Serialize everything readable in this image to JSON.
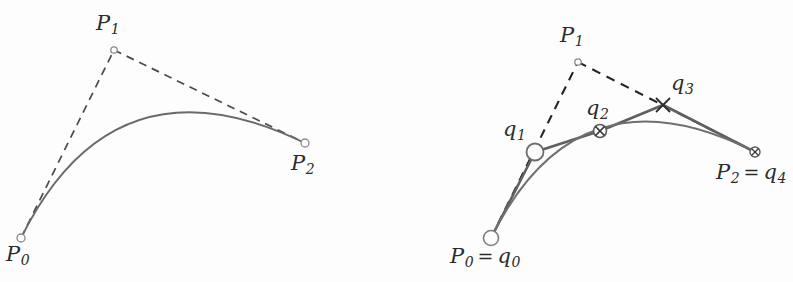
{
  "figure": {
    "background_color": "#fdfdfd",
    "curve_color": "#6a6a6a",
    "dashed_color": "#4a4a4a",
    "dashed_color_right": "#242424",
    "polyline_color": "#5f5f5f",
    "label_color": "#2b2b2b",
    "width": 793,
    "height": 282
  },
  "left_panel": {
    "name": "bezier-control-polygon",
    "labels": {
      "p0": {
        "base": "P",
        "sub": "0"
      },
      "p1": {
        "base": "P",
        "sub": "1"
      },
      "p2": {
        "base": "P",
        "sub": "2"
      }
    },
    "points": {
      "p0": {
        "x": 21,
        "y": 238,
        "marker": "small-open-circle"
      },
      "p1": {
        "x": 114,
        "y": 50,
        "marker": "tiny-open-circle"
      },
      "p2": {
        "x": 305,
        "y": 143,
        "marker": "small-open-circle"
      }
    },
    "curve": {
      "type": "quadratic-bezier",
      "start": {
        "x": 21,
        "y": 238
      },
      "control": {
        "x": 114,
        "y": 50
      },
      "end": {
        "x": 305,
        "y": 143
      }
    }
  },
  "right_panel": {
    "name": "bezier-subdivision-polyline",
    "labels": {
      "p0q0": {
        "base": "P",
        "sub": "0",
        "eq": "=",
        "base2": "q",
        "sub2": "0"
      },
      "p1": {
        "base": "P",
        "sub": "1"
      },
      "p2q4": {
        "base": "P",
        "sub": "2",
        "eq": "=",
        "base2": "q",
        "sub2": "4"
      },
      "q1": {
        "base": "q",
        "sub": "1"
      },
      "q2": {
        "base": "q",
        "sub": "2"
      },
      "q3": {
        "base": "q",
        "sub": "3"
      }
    },
    "points": {
      "q0": {
        "x": 491,
        "y": 238,
        "marker": "large-open-circle"
      },
      "q1": {
        "x": 535,
        "y": 152,
        "marker": "large-open-circle"
      },
      "q2": {
        "x": 600,
        "y": 131,
        "marker": "crossed-circle"
      },
      "q3": {
        "x": 663,
        "y": 105,
        "marker": "cross"
      },
      "q4": {
        "x": 755,
        "y": 152,
        "marker": "crossed-circle"
      },
      "p1": {
        "x": 578,
        "y": 62,
        "marker": "tiny-open-circle"
      }
    },
    "curve": {
      "type": "quadratic-bezier",
      "start": {
        "x": 491,
        "y": 238
      },
      "control": {
        "x": 578,
        "y": 62
      },
      "end": {
        "x": 755,
        "y": 152
      }
    },
    "polyline": [
      {
        "x": 491,
        "y": 238
      },
      {
        "x": 535,
        "y": 152
      },
      {
        "x": 600,
        "y": 131
      },
      {
        "x": 663,
        "y": 105
      },
      {
        "x": 755,
        "y": 152
      }
    ]
  }
}
